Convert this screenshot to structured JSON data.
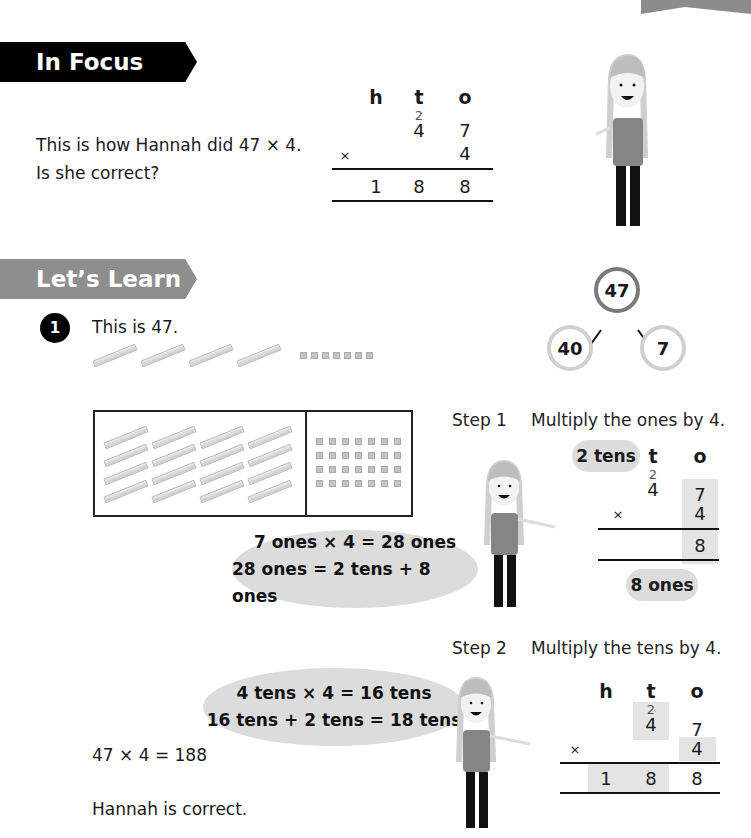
{
  "in_focus": {
    "banner_label": "In Focus",
    "question_line1": "This is how Hannah did 47 × 4.",
    "question_line2": "Is she correct?",
    "column_method": {
      "headers": [
        "h",
        "t",
        "o"
      ],
      "carry_t": "2",
      "row1": [
        "",
        "4",
        "7"
      ],
      "operator": "×",
      "row2": [
        "",
        "",
        "4"
      ],
      "result": [
        "1",
        "8",
        "8"
      ]
    }
  },
  "lets_learn": {
    "banner_label": "Let’s Learn",
    "item_number": "1",
    "intro_text": "This is 47.",
    "number_bond": {
      "whole": "47",
      "part1": "40",
      "part2": "7"
    },
    "step1": {
      "label": "Step 1",
      "instruction": "Multiply the ones by 4.",
      "tens_bubble": "2 tens",
      "ones_bubble": "8 ones",
      "speech_line1": "7 ones × 4 = 28 ones",
      "speech_line2": "28 ones = 2 tens + 8 ones",
      "column_method": {
        "headers": [
          "t",
          "o"
        ],
        "carry_t": "2",
        "row1": [
          "4",
          "7"
        ],
        "operator": "×",
        "row2": [
          "",
          "4"
        ],
        "result": [
          "",
          "8"
        ]
      }
    },
    "step2": {
      "label": "Step 2",
      "instruction": "Multiply the tens by 4.",
      "speech_line1": "4 tens × 4 = 16 tens",
      "speech_line2": "16 tens + 2 tens = 18 tens",
      "column_method": {
        "headers": [
          "h",
          "t",
          "o"
        ],
        "carry_t": "2",
        "row1": [
          "",
          "4",
          "7"
        ],
        "operator": "×",
        "row2": [
          "",
          "",
          "4"
        ],
        "result": [
          "1",
          "8",
          "8"
        ]
      }
    },
    "final_equation": "47 × 4 = 188",
    "conclusion": "Hannah is correct."
  }
}
